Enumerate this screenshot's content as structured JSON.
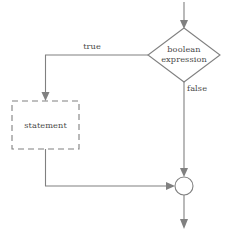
{
  "diagram": {
    "type": "flowchart",
    "background_color": "#ffffff",
    "line_color": "#808080",
    "text_color": "#4a4a4a",
    "nodes": {
      "decision": {
        "shape": "diamond",
        "label_line1": "boolean",
        "label_line2": "expression",
        "center_x": 184,
        "center_y": 55,
        "half_width": 36,
        "half_height": 27
      },
      "statement": {
        "shape": "rectangle-dashed",
        "label": "statement",
        "x": 12,
        "y": 101,
        "width": 67,
        "height": 48
      },
      "merge": {
        "shape": "circle",
        "center_x": 184,
        "center_y": 186,
        "radius": 9
      }
    },
    "edge_labels": {
      "true_branch": "true",
      "false_branch": "false"
    }
  }
}
